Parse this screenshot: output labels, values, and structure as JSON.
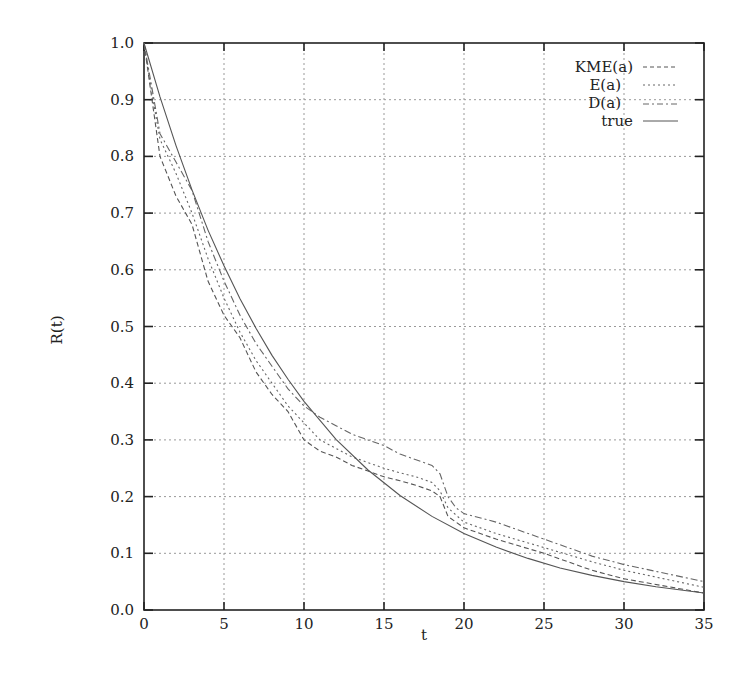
{
  "chart_data": {
    "type": "line",
    "title": "",
    "xlabel": "t",
    "ylabel": "R(t)",
    "xlim": [
      0,
      35
    ],
    "ylim": [
      0.0,
      1.0
    ],
    "grid": true,
    "legend_position": "upper right",
    "x_ticks": [
      0,
      5,
      10,
      15,
      20,
      25,
      30,
      35
    ],
    "x_tick_labels": [
      "0",
      "5",
      "10",
      "15",
      "20",
      "25",
      "30",
      "35"
    ],
    "y_ticks": [
      0.0,
      0.1,
      0.2,
      0.3,
      0.4,
      0.5,
      0.6,
      0.7,
      0.8,
      0.9,
      1.0
    ],
    "y_tick_labels": [
      "0.0",
      "0.1",
      "0.2",
      "0.3",
      "0.4",
      "0.5",
      "0.6",
      "0.7",
      "0.8",
      "0.9",
      "1.0"
    ],
    "series": [
      {
        "name": "KME(a)",
        "style": "dashed",
        "color": "#555555",
        "x": [
          0,
          0.5,
          1,
          2,
          3,
          4,
          5,
          6,
          7,
          8,
          9,
          10,
          11,
          12,
          13,
          14,
          15,
          16,
          17,
          18,
          18.5,
          19,
          20,
          22,
          25,
          28,
          30,
          35
        ],
        "y": [
          1.0,
          0.9,
          0.8,
          0.73,
          0.68,
          0.58,
          0.52,
          0.48,
          0.42,
          0.38,
          0.35,
          0.3,
          0.28,
          0.27,
          0.255,
          0.245,
          0.235,
          0.228,
          0.22,
          0.21,
          0.2,
          0.165,
          0.145,
          0.125,
          0.1,
          0.07,
          0.055,
          0.03
        ]
      },
      {
        "name": "E(a)",
        "style": "dotted",
        "color": "#666666",
        "x": [
          0,
          0.5,
          1,
          2,
          3,
          4,
          5,
          6,
          7,
          8,
          9,
          10,
          11,
          12,
          13,
          14,
          15,
          16,
          17,
          18,
          18.5,
          19,
          20,
          22,
          25,
          28,
          30,
          35
        ],
        "y": [
          1.0,
          0.91,
          0.83,
          0.77,
          0.7,
          0.62,
          0.55,
          0.49,
          0.44,
          0.4,
          0.36,
          0.33,
          0.3,
          0.285,
          0.27,
          0.26,
          0.25,
          0.242,
          0.235,
          0.225,
          0.21,
          0.18,
          0.155,
          0.135,
          0.11,
          0.085,
          0.07,
          0.04
        ]
      },
      {
        "name": "D(a)",
        "style": "dashdot",
        "color": "#666666",
        "x": [
          0,
          0.5,
          1,
          2,
          3,
          4,
          5,
          6,
          7,
          8,
          9,
          10,
          11,
          12,
          13,
          14,
          15,
          16,
          17,
          18,
          18.5,
          19,
          19.5,
          20,
          22,
          25,
          28,
          30,
          35
        ],
        "y": [
          1.0,
          0.92,
          0.84,
          0.79,
          0.74,
          0.65,
          0.58,
          0.52,
          0.47,
          0.43,
          0.39,
          0.36,
          0.34,
          0.325,
          0.31,
          0.3,
          0.29,
          0.275,
          0.265,
          0.255,
          0.24,
          0.2,
          0.18,
          0.17,
          0.155,
          0.125,
          0.095,
          0.08,
          0.05
        ]
      },
      {
        "name": "true",
        "style": "solid",
        "color": "#555555",
        "x": [
          0,
          1,
          2,
          3,
          4,
          5,
          6,
          7,
          8,
          9,
          10,
          12,
          14,
          16,
          18,
          20,
          22,
          24,
          26,
          28,
          30,
          32,
          35
        ],
        "y": [
          1.0,
          0.905,
          0.819,
          0.741,
          0.67,
          0.607,
          0.549,
          0.497,
          0.449,
          0.407,
          0.368,
          0.301,
          0.247,
          0.202,
          0.165,
          0.135,
          0.111,
          0.091,
          0.074,
          0.061,
          0.05,
          0.041,
          0.03
        ]
      }
    ]
  },
  "legend": {
    "items": [
      {
        "label": "KME(a)"
      },
      {
        "label": "E(a)"
      },
      {
        "label": "D(a)"
      },
      {
        "label": "true"
      }
    ]
  }
}
